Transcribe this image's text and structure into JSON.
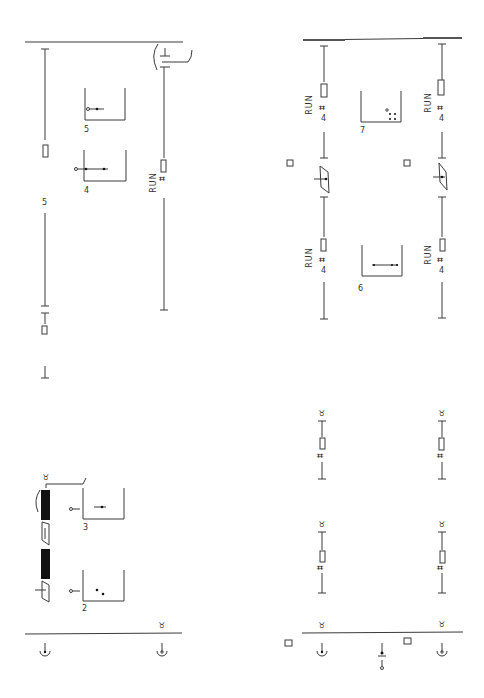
{
  "diagram": {
    "type": "ladder-notation-rotated",
    "orientation": "rotated 90deg (page read sideways)",
    "line_color": "#3a3a3a",
    "background": "#ffffff"
  },
  "labels": {
    "run_1": "RUN",
    "run_2": "RUN",
    "run_3": "RUN",
    "run_4": "RUN",
    "run_5": "RUN",
    "box_num_2": "2",
    "box_num_3": "3",
    "box_num_4": "4",
    "box_num_5": "5",
    "box_num_6": "6",
    "box_num_7": "7",
    "count_5": "5",
    "count_4a": "4",
    "count_4b": "4",
    "count_4c": "4",
    "count_4d": "4",
    "count_4e": "4"
  },
  "glyphs": {
    "taurus": "♉",
    "ground": "⏚",
    "hash": "⌗",
    "box_t": "⊞"
  }
}
